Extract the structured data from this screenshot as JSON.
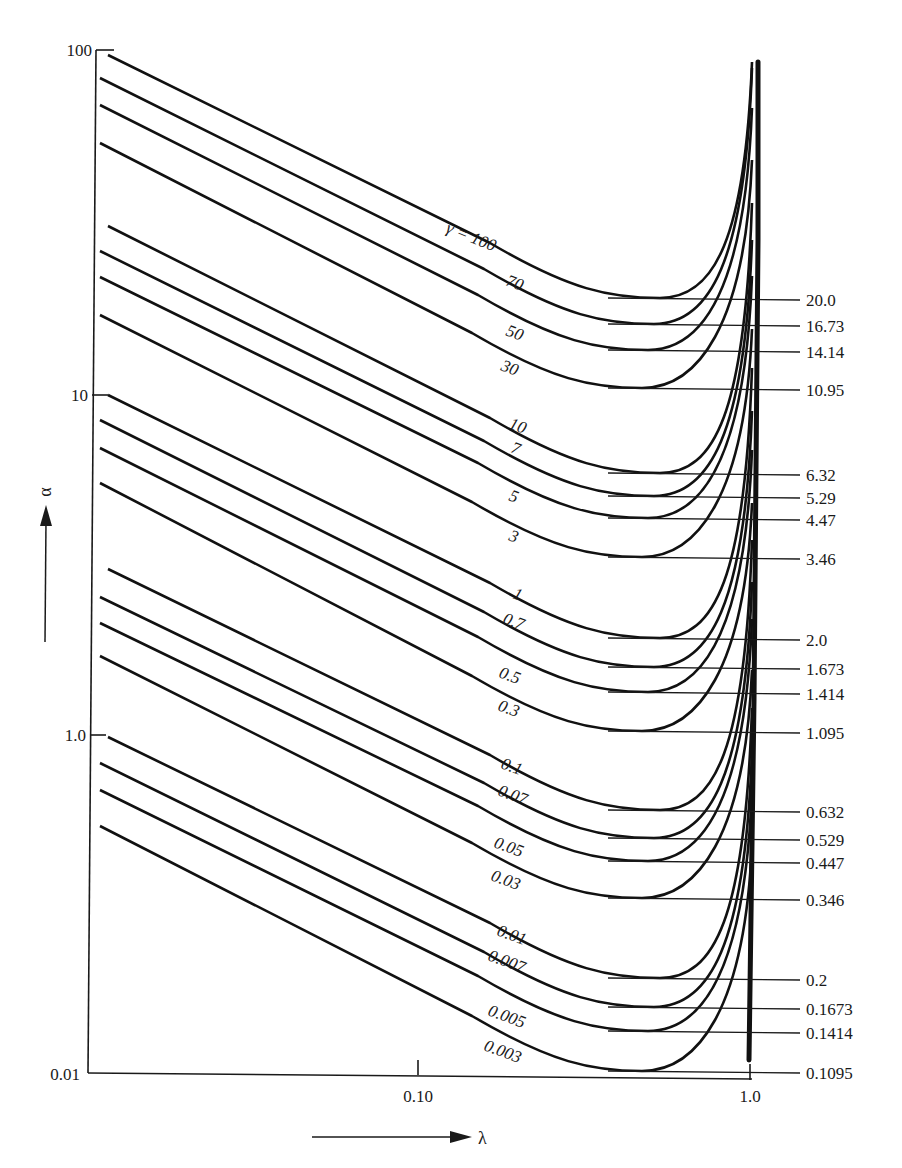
{
  "chart_data": {
    "type": "line",
    "title": "",
    "xlabel": "λ",
    "ylabel": "α",
    "x_scale": "log",
    "y_scale": "log",
    "xlim": [
      0.012,
      1.0
    ],
    "x_ticks": [
      "0.10",
      "1.0"
    ],
    "y_ticks": [
      "100",
      "10",
      "1.0",
      "0.01"
    ],
    "grid": false,
    "legend": "inline curve labels",
    "curve_label_prefix": "γ = ",
    "series": [
      {
        "name": "100",
        "min_alpha": "20.0"
      },
      {
        "name": "70",
        "min_alpha": "16.73"
      },
      {
        "name": "50",
        "min_alpha": "14.14"
      },
      {
        "name": "30",
        "min_alpha": "10.95"
      },
      {
        "name": "10",
        "min_alpha": "6.32"
      },
      {
        "name": "7",
        "min_alpha": "5.29"
      },
      {
        "name": "5",
        "min_alpha": "4.47"
      },
      {
        "name": "3",
        "min_alpha": "3.46"
      },
      {
        "name": "1",
        "min_alpha": "2.0"
      },
      {
        "name": "0.7",
        "min_alpha": "1.673"
      },
      {
        "name": "0.5",
        "min_alpha": "1.414"
      },
      {
        "name": "0.3",
        "min_alpha": "1.095"
      },
      {
        "name": "0.1",
        "min_alpha": "0.632"
      },
      {
        "name": "0.07",
        "min_alpha": "0.529"
      },
      {
        "name": "0.05",
        "min_alpha": "0.447"
      },
      {
        "name": "0.03",
        "min_alpha": "0.346"
      },
      {
        "name": "0.01",
        "min_alpha": "0.2"
      },
      {
        "name": "0.007",
        "min_alpha": "0.1673"
      },
      {
        "name": "0.005",
        "min_alpha": "0.1414"
      },
      {
        "name": "0.003",
        "min_alpha": "0.1095"
      }
    ],
    "annotations": {
      "vertical_asymptote_at_lambda": "1.0",
      "minimum_near_lambda": "0.5"
    }
  },
  "geometry": {
    "curves": [
      {
        "label": "γ = 100",
        "y0": 55,
        "ymin": 298,
        "lx": 445,
        "ly": 232,
        "rot": 22
      },
      {
        "label": "70",
        "y0": 78,
        "ymin": 324,
        "lx": 505,
        "ly": 285,
        "rot": 20
      },
      {
        "label": "50",
        "y0": 105,
        "ymin": 350,
        "lx": 505,
        "ly": 335,
        "rot": 20
      },
      {
        "label": "30",
        "y0": 143,
        "ymin": 388,
        "lx": 500,
        "ly": 370,
        "rot": 20
      },
      {
        "label": "10",
        "y0": 226,
        "ymin": 473,
        "lx": 508,
        "ly": 428,
        "rot": 20
      },
      {
        "label": "7",
        "y0": 251,
        "ymin": 496,
        "lx": 510,
        "ly": 452,
        "rot": 20
      },
      {
        "label": "5",
        "y0": 277,
        "ymin": 518,
        "lx": 508,
        "ly": 500,
        "rot": 20
      },
      {
        "label": "3",
        "y0": 315,
        "ymin": 557,
        "lx": 508,
        "ly": 540,
        "rot": 20
      },
      {
        "label": "1",
        "y0": 395,
        "ymin": 638,
        "lx": 512,
        "ly": 598,
        "rot": 20
      },
      {
        "label": "0.7",
        "y0": 420,
        "ymin": 667,
        "lx": 502,
        "ly": 623,
        "rot": 20
      },
      {
        "label": "0.5",
        "y0": 448,
        "ymin": 692,
        "lx": 498,
        "ly": 677,
        "rot": 20
      },
      {
        "label": "0.3",
        "y0": 483,
        "ymin": 731,
        "lx": 497,
        "ly": 710,
        "rot": 20
      },
      {
        "label": "0.1",
        "y0": 569,
        "ymin": 810,
        "lx": 500,
        "ly": 768,
        "rot": 20
      },
      {
        "label": "0.07",
        "y0": 597,
        "ymin": 838,
        "lx": 497,
        "ly": 795,
        "rot": 20
      },
      {
        "label": "0.05",
        "y0": 623,
        "ymin": 861,
        "lx": 493,
        "ly": 847,
        "rot": 20
      },
      {
        "label": "0.03",
        "y0": 656,
        "ymin": 898,
        "lx": 490,
        "ly": 880,
        "rot": 20
      },
      {
        "label": "0.01",
        "y0": 737,
        "ymin": 978,
        "lx": 496,
        "ly": 935,
        "rot": 20
      },
      {
        "label": "0.007",
        "y0": 763,
        "ymin": 1007,
        "lx": 487,
        "ly": 960,
        "rot": 20
      },
      {
        "label": "0.005",
        "y0": 790,
        "ymin": 1031,
        "lx": 487,
        "ly": 1015,
        "rot": 20
      },
      {
        "label": "0.003",
        "y0": 826,
        "ymin": 1071,
        "lx": 483,
        "ly": 1050,
        "rot": 20
      }
    ]
  }
}
